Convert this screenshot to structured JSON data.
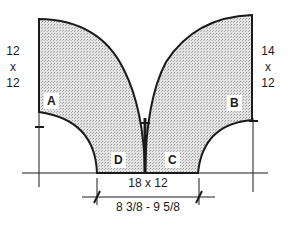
{
  "diagram": {
    "type": "cutting-layout",
    "pieces": [
      {
        "id": "A",
        "label": "A",
        "size_label": [
          "12",
          "x",
          "12"
        ]
      },
      {
        "id": "B",
        "label": "B",
        "size_label": [
          "14",
          "x",
          "12"
        ]
      },
      {
        "id": "C",
        "label": "C"
      },
      {
        "id": "D",
        "label": "D"
      }
    ],
    "bottom_dimension": "18 x 12",
    "gap_dimension": "8 3/8 - 9 5/8",
    "colors": {
      "fill": "#cfcfcf",
      "stroke": "#1a1a1a",
      "background": "#ffffff"
    }
  }
}
